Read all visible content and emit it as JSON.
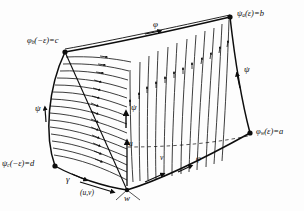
{
  "figure": {
    "type": "diagram",
    "background_color": "#fdfdfd",
    "ink_color": "#0d0d0d"
  },
  "vertices": [
    {
      "id": "top-left",
      "name": "phi-b-corner",
      "label_html": "φ<sub>b</sub>(−ε)=c",
      "symbol": "φ",
      "subscript": "b",
      "argument": "(−ε)",
      "value": "c",
      "x": 65,
      "y": 52,
      "label_x": 27,
      "label_y": 38
    },
    {
      "id": "top-right",
      "name": "psi-a-corner",
      "label_html": "ψ<sub>a</sub>(ε)=b",
      "symbol": "ψ",
      "subscript": "a",
      "argument": "(ε)",
      "value": "b",
      "x": 230,
      "y": 17,
      "label_x": 237,
      "label_y": 10
    },
    {
      "id": "bottom-right",
      "name": "phi-w-corner",
      "label_html": "φ<sub>w</sub>(ε)=a",
      "symbol": "φ",
      "subscript": "w",
      "argument": "(ε)",
      "value": "a",
      "x": 250,
      "y": 133,
      "label_x": 256,
      "label_y": 128
    },
    {
      "id": "bottom-left",
      "name": "psi-c-corner",
      "label_html": "ψ<sub>c</sub>(−ε)=d",
      "symbol": "ψ",
      "subscript": "c",
      "argument": "(−ε)",
      "value": "d",
      "x": 55,
      "y": 166,
      "label_x": 2,
      "label_y": 160
    },
    {
      "id": "bottom-apex",
      "name": "w-vertex",
      "label_html": "w",
      "symbol": "w",
      "x": 127,
      "y": 190,
      "label_x": 124,
      "label_y": 193
    }
  ],
  "edge_labels": [
    {
      "name": "phi-top-label",
      "text": "φ",
      "x": 153,
      "y": 24
    },
    {
      "name": "psi-right-label",
      "text": "ψ",
      "x": 244,
      "y": 68
    },
    {
      "name": "phi-bottom-label",
      "text": "φ",
      "x": 196,
      "y": 158
    },
    {
      "name": "psi-left-label",
      "text": "ψ",
      "x": 35,
      "y": 108
    },
    {
      "name": "psi-middle-label",
      "text": "ψ",
      "x": 127,
      "y": 106
    },
    {
      "name": "gamma-label",
      "text": "γ",
      "x": 68,
      "y": 177
    },
    {
      "name": "uv-label",
      "text": "(u,v)",
      "x": 84,
      "y": 190
    },
    {
      "name": "u-label",
      "text": "u",
      "x": 124,
      "y": 144
    },
    {
      "name": "v-label",
      "text": "v",
      "x": 160,
      "y": 157
    }
  ],
  "curve_families": [
    {
      "name": "phi-curves",
      "role": "fan of phi integral curves emanating from the upper-left corner toward the bottom apex region",
      "arrow_direction": "rightward/outward",
      "count": 18
    },
    {
      "name": "psi-curves",
      "role": "near-vertical family of psi integral curves crossing the patch from the bottom edge up to the top edge",
      "arrow_direction": "upward",
      "count": 15
    }
  ],
  "boundary": {
    "name": "patch-boundary",
    "edges": [
      "top edge phi from phi_b(-e)=c to psi_a(e)=b",
      "right edge psi from psi_a(e)=b to phi_w(e)=a",
      "bottom edge phi from w to phi_w(e)=a",
      "left edge psi from psi_c(-e)=d up to phi_b(-e)=c",
      "gamma edge from psi_c(-e)=d to w"
    ]
  }
}
